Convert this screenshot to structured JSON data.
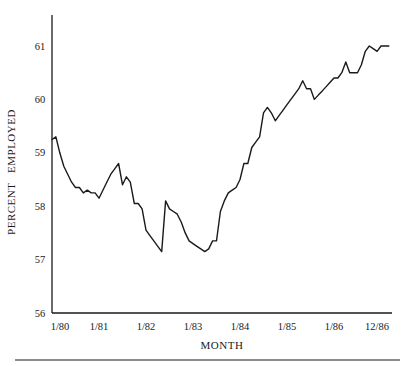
{
  "chart_data": {
    "type": "line",
    "title": "",
    "xlabel": "MONTH",
    "ylabel": "PERCENT   EMPLOYED",
    "ylim": [
      56,
      61.5
    ],
    "yticks": [
      56,
      57,
      58,
      59,
      60,
      61
    ],
    "ytick_labels": [
      "56",
      "57",
      "58",
      "59",
      "60",
      "61"
    ],
    "xtick_labels": [
      "1/80",
      "1/81",
      "1/82",
      "1/83",
      "1/84",
      "1/85",
      "1/86",
      "12/86"
    ],
    "xtick_months": [
      0,
      12,
      24,
      36,
      48,
      60,
      72,
      83
    ],
    "grid": false,
    "legend": null,
    "series": [
      {
        "name": "Percent Employed",
        "x_months": [
          0,
          1,
          2,
          3,
          4,
          5,
          6,
          7,
          8,
          9,
          10,
          11,
          12,
          13,
          14,
          15,
          16,
          17,
          18,
          19,
          20,
          21,
          22,
          23,
          24,
          25,
          26,
          27,
          28,
          29,
          30,
          31,
          32,
          33,
          34,
          35,
          36,
          37,
          38,
          39,
          40,
          41,
          42,
          43,
          44,
          45,
          46,
          47,
          48,
          49,
          50,
          51,
          52,
          53,
          54,
          55,
          56,
          57,
          58,
          59,
          60,
          61,
          62,
          63,
          64,
          65,
          66,
          67,
          68,
          69,
          70,
          71,
          72,
          73,
          74,
          75,
          76,
          77,
          78,
          79,
          80,
          81,
          82,
          83,
          84,
          85,
          86
        ],
        "values": [
          59.25,
          59.3,
          59.0,
          58.75,
          58.6,
          58.45,
          58.35,
          58.35,
          58.25,
          58.3,
          58.25,
          58.25,
          58.15,
          58.3,
          58.45,
          58.6,
          58.7,
          58.8,
          58.4,
          58.55,
          58.45,
          58.05,
          58.05,
          57.95,
          57.55,
          57.45,
          57.35,
          57.25,
          57.15,
          58.1,
          57.95,
          57.9,
          57.85,
          57.7,
          57.5,
          57.35,
          57.3,
          57.25,
          57.2,
          57.15,
          57.2,
          57.35,
          57.35,
          57.9,
          58.1,
          58.25,
          58.3,
          58.35,
          58.5,
          58.8,
          58.8,
          59.1,
          59.2,
          59.3,
          59.75,
          59.85,
          59.75,
          59.6,
          59.7,
          59.8,
          59.9,
          60.0,
          60.1,
          60.2,
          60.35,
          60.2,
          60.2,
          60.0,
          60.08,
          60.16,
          60.24,
          60.32,
          60.4,
          60.4,
          60.5,
          60.7,
          60.5,
          60.5,
          60.5,
          60.65,
          60.9,
          61.0,
          60.95,
          60.9,
          61.0,
          61.0,
          61.0
        ]
      }
    ]
  },
  "axes": {
    "x_title": "MONTH",
    "y_title": "PERCENT   EMPLOYED"
  },
  "style": {
    "line_color": "#1a1a1a",
    "axis_color": "#1a1a1a",
    "background": "#ffffff"
  }
}
